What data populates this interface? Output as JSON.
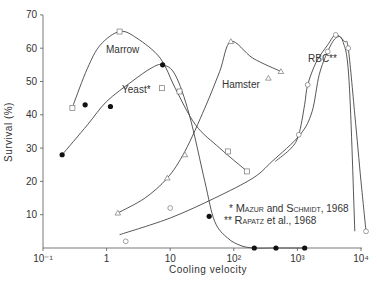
{
  "chart_data": {
    "type": "scatter",
    "title": "",
    "xlabel": "Cooling velocity",
    "ylabel": "Survival (%)",
    "xscale": "log",
    "xlim": [
      0.1,
      10000
    ],
    "ylim": [
      0,
      70
    ],
    "grid": false,
    "x_ticks": [
      "10⁻¹",
      "1",
      "10",
      "10²",
      "10³",
      "10⁴"
    ],
    "y_ticks": [
      "10",
      "20",
      "30",
      "40",
      "50",
      "60",
      "70"
    ],
    "series": [
      {
        "name": "Marrow",
        "marker": "open-square",
        "points": [
          [
            0.29,
            42
          ],
          [
            1.6,
            65
          ],
          [
            7.4,
            48
          ],
          [
            14,
            47
          ],
          [
            81,
            29
          ],
          [
            162,
            23
          ]
        ],
        "curve": [
          [
            0.3,
            43
          ],
          [
            0.5,
            54
          ],
          [
            0.8,
            61
          ],
          [
            1.6,
            65
          ],
          [
            3,
            63
          ],
          [
            7,
            57
          ],
          [
            12,
            48
          ],
          [
            25,
            37
          ],
          [
            60,
            30
          ],
          [
            162,
            23
          ]
        ]
      },
      {
        "name": "Yeast*",
        "marker": "filled-circle",
        "points": [
          [
            0.2,
            28
          ],
          [
            0.46,
            43
          ],
          [
            1.15,
            42.5
          ],
          [
            7.6,
            55
          ],
          [
            41,
            9.5
          ],
          [
            210,
            0
          ],
          [
            460,
            0
          ],
          [
            1300,
            0
          ]
        ],
        "curve": [
          [
            0.2,
            28
          ],
          [
            0.5,
            37
          ],
          [
            1,
            44
          ],
          [
            2.5,
            50
          ],
          [
            5,
            54
          ],
          [
            7.6,
            55
          ],
          [
            12,
            52
          ],
          [
            20,
            40
          ],
          [
            35,
            20
          ],
          [
            50,
            8
          ],
          [
            80,
            3
          ],
          [
            130,
            0.7
          ],
          [
            210,
            0
          ],
          [
            460,
            0
          ],
          [
            1300,
            0
          ]
        ]
      },
      {
        "name": "Hamster",
        "marker": "open-triangle",
        "points": [
          [
            1.5,
            10.5
          ],
          [
            9,
            21
          ],
          [
            17,
            28
          ],
          [
            90,
            62
          ],
          [
            350,
            51
          ],
          [
            550,
            53
          ]
        ],
        "curve": [
          [
            1.5,
            10.5
          ],
          [
            4,
            15
          ],
          [
            9,
            21
          ],
          [
            17,
            29
          ],
          [
            35,
            42
          ],
          [
            60,
            53
          ],
          [
            90,
            62
          ],
          [
            200,
            57
          ],
          [
            550,
            53
          ]
        ],
        "secondary_curve": [
          [
            1.6,
            4
          ],
          [
            10,
            9
          ],
          [
            50,
            15
          ],
          [
            200,
            21
          ],
          [
            400,
            26
          ],
          [
            1100,
            34
          ],
          [
            1700,
            41
          ],
          [
            2200,
            52
          ],
          [
            3000,
            59
          ],
          [
            4000,
            63
          ],
          [
            5200,
            62
          ],
          [
            6500,
            50
          ],
          [
            8000,
            5
          ]
        ]
      },
      {
        "name": "RBC**",
        "marker": "open-circle",
        "points": [
          [
            2,
            2
          ],
          [
            10,
            12
          ],
          [
            1050,
            34
          ],
          [
            1450,
            49
          ],
          [
            3000,
            59
          ],
          [
            4000,
            64
          ],
          [
            6300,
            60
          ],
          [
            12000,
            5
          ]
        ],
        "curve": [
          [
            450,
            26
          ],
          [
            800,
            30
          ],
          [
            1050,
            34
          ],
          [
            1300,
            43
          ],
          [
            1450,
            49
          ],
          [
            2000,
            56
          ],
          [
            3000,
            61
          ],
          [
            4000,
            64
          ],
          [
            5500,
            62
          ],
          [
            6300,
            60
          ],
          [
            8000,
            40
          ],
          [
            10000,
            20
          ],
          [
            12000,
            5
          ]
        ]
      }
    ],
    "annotations": [
      {
        "text": "Marrow",
        "x": 1.3,
        "y": 60
      },
      {
        "text": "Yeast*",
        "x": 2.2,
        "y": 48
      },
      {
        "text": "Hamster",
        "x": 110,
        "y": 52
      },
      {
        "text": "RBC**",
        "x": 2500,
        "y": 53
      }
    ],
    "legend": [
      {
        "marker": "*",
        "text": "MAZUR and SCHMIDT, 1968"
      },
      {
        "marker": "**",
        "text": "RAPATZ et al., 1968"
      }
    ]
  },
  "labels": {
    "ylabel": "Survival (%)",
    "xlabel": "Cooling velocity",
    "marrow": "Marrow",
    "yeast": "Yeast*",
    "hamster": "Hamster",
    "rbc": "RBC**",
    "legend1": "* Mazur and Schmidt, 1968",
    "legend2": "** Rapatz et al., 1968"
  }
}
